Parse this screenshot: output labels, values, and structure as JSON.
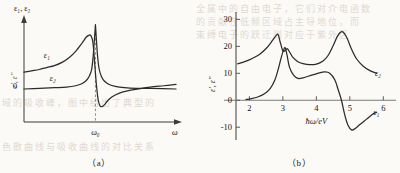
{
  "figure": {
    "background_color": "#fbfaf7",
    "ink_color": "#2b2b2b",
    "bleed_text_color": "#d8cfc6",
    "bleed_lines": [
      "全属中的自由电子，它们对介电函数",
      "的贡献在低频区域占主导地位，而",
      "束缚电子的跃迁则对应于紫外区",
      "域的吸收峰，图中给出了典型的",
      "色散曲线与吸收曲线的对比关系"
    ]
  },
  "chart_data": [
    {
      "id": "panel-a",
      "type": "line",
      "caption": "（a）",
      "title": "",
      "ylabel": "ε₁, ε₂",
      "xlabel": "ω",
      "y_axis_origin_label": "0",
      "x_tick_labels": [
        "ω₀"
      ],
      "x_tick_values": [
        0.47
      ],
      "y_tick_labels": [],
      "grid": false,
      "legend_position": "inline",
      "annotations": [
        {
          "text": "ω₀",
          "kind": "x-marker",
          "dashed_vertical": true
        }
      ],
      "series": [
        {
          "name": "ε₁",
          "label": "ε₁",
          "label_x": 0.13,
          "label_y": 0.47,
          "description": "real part / dispersion: rises to a maximum just below ω₀, drops steeply through resonance to a deep minimum just above ω₀, then recovers asymptotically",
          "x": [
            0.0,
            0.05,
            0.1,
            0.15,
            0.2,
            0.25,
            0.3,
            0.34,
            0.38,
            0.41,
            0.43,
            0.44,
            0.45,
            0.455,
            0.46,
            0.465,
            0.47,
            0.475,
            0.48,
            0.485,
            0.49,
            0.5,
            0.515,
            0.53,
            0.55,
            0.58,
            0.62,
            0.68,
            0.75,
            0.83,
            0.92,
            1.0
          ],
          "y": [
            0.26,
            0.28,
            0.3,
            0.33,
            0.36,
            0.41,
            0.49,
            0.58,
            0.7,
            0.8,
            0.83,
            0.82,
            0.76,
            0.68,
            0.55,
            0.4,
            0.24,
            0.1,
            -0.02,
            -0.12,
            -0.19,
            -0.26,
            -0.27,
            -0.24,
            -0.18,
            -0.12,
            -0.07,
            -0.03,
            0.0,
            0.03,
            0.05,
            0.07
          ]
        },
        {
          "name": "ε₂",
          "label": "ε₂",
          "label_x": 0.17,
          "label_y": 0.13,
          "description": "imaginary part / absorption: near zero, sharp Lorentzian peak centred at ω₀, decays back to zero",
          "x": [
            0.0,
            0.1,
            0.2,
            0.28,
            0.34,
            0.38,
            0.41,
            0.43,
            0.445,
            0.455,
            0.462,
            0.468,
            0.47,
            0.472,
            0.478,
            0.485,
            0.495,
            0.51,
            0.53,
            0.56,
            0.6,
            0.66,
            0.74,
            0.84,
            1.0
          ],
          "y": [
            0.0,
            0.01,
            0.02,
            0.03,
            0.05,
            0.08,
            0.13,
            0.2,
            0.3,
            0.5,
            0.72,
            0.92,
            0.99,
            0.92,
            0.7,
            0.48,
            0.3,
            0.19,
            0.12,
            0.07,
            0.04,
            0.02,
            0.01,
            0.01,
            0.0
          ]
        }
      ]
    },
    {
      "id": "panel-b",
      "type": "line",
      "caption": "（b）",
      "title": "",
      "ylabel": "ε', ε''",
      "xlabel": "ħω/eV",
      "xlim": [
        1.6,
        6.2
      ],
      "ylim": [
        -14,
        32
      ],
      "x_tick_labels": [
        "2",
        "3",
        "4",
        "5",
        "6"
      ],
      "x_tick_values": [
        2,
        3,
        4,
        5,
        6
      ],
      "y_tick_labels": [
        "-10",
        "0",
        "10",
        "20",
        "30"
      ],
      "y_tick_values": [
        -10,
        0,
        10,
        20,
        30
      ],
      "grid": false,
      "legend_position": "inline-right",
      "series": [
        {
          "name": "ε₂",
          "label": "ε₂",
          "label_x": 5.75,
          "label_y": 9.0,
          "description": "absorption: starts ~13.5 at 1.65 eV, main peak 24.5 at 2.85 eV, shoulder peak 19 at 3.17 eV, broad minimum ~13 near 3.9 eV, second large peak 25.3 at 4.75 eV, falls to ~10 by 5.8 eV",
          "x": [
            1.65,
            1.9,
            2.1,
            2.3,
            2.5,
            2.65,
            2.75,
            2.85,
            2.92,
            3.0,
            3.08,
            3.14,
            3.2,
            3.3,
            3.45,
            3.6,
            3.8,
            4.0,
            4.2,
            4.35,
            4.5,
            4.62,
            4.72,
            4.8,
            4.92,
            5.05,
            5.2,
            5.4,
            5.6,
            5.8
          ],
          "y": [
            13.5,
            14.5,
            15.6,
            17.0,
            19.2,
            21.5,
            23.2,
            24.5,
            21.6,
            18.3,
            18.6,
            19.1,
            17.9,
            15.9,
            14.3,
            13.6,
            13.2,
            13.4,
            14.6,
            16.6,
            20.2,
            23.5,
            25.2,
            25.3,
            23.0,
            19.0,
            15.4,
            12.6,
            11.0,
            10.0
          ]
        },
        {
          "name": "ε₁",
          "label": "ε₁",
          "label_x": 5.7,
          "label_y": -5.5,
          "description": "dispersion: near 0.3 at 1.9 eV, rises steeply to peak 19.5 at 3.05 eV, drops to ~8 at 3.5 eV, rises to 10.5 at 4.25 eV, crosses zero at 4.75 eV, deep minimum -11 at 5.05 eV, recovers to -4.5 at 5.8 eV",
          "x": [
            1.9,
            2.05,
            2.25,
            2.45,
            2.62,
            2.75,
            2.85,
            2.95,
            3.02,
            3.07,
            3.12,
            3.2,
            3.32,
            3.45,
            3.6,
            3.78,
            3.95,
            4.1,
            4.25,
            4.4,
            4.55,
            4.65,
            4.75,
            4.85,
            4.95,
            5.05,
            5.15,
            5.3,
            5.5,
            5.7,
            5.8
          ],
          "y": [
            0.3,
            0.55,
            1.2,
            2.4,
            4.3,
            7.2,
            11.0,
            15.8,
            18.6,
            19.5,
            17.0,
            12.2,
            9.3,
            8.1,
            8.3,
            9.0,
            9.6,
            10.2,
            10.5,
            10.0,
            7.6,
            4.0,
            0.0,
            -5.5,
            -9.4,
            -11.0,
            -10.6,
            -9.0,
            -7.0,
            -5.0,
            -4.5
          ]
        }
      ]
    }
  ]
}
